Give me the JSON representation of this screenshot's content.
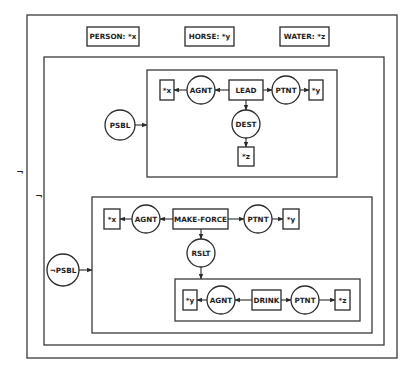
{
  "diagram": {
    "type": "conceptual-graph",
    "negations": [
      "¬",
      "¬"
    ],
    "declarations": [
      {
        "id": "decl-person",
        "label": "PERSON:  *x"
      },
      {
        "id": "decl-horse",
        "label": "HORSE:  *y"
      },
      {
        "id": "decl-water",
        "label": "WATER:  *z"
      }
    ],
    "contexts": {
      "possible": {
        "modal": "PSBL",
        "nodes": {
          "x": "*x",
          "agnt": "AGNT",
          "act": "LEAD",
          "ptnt": "PTNT",
          "y": "*y",
          "dest": "DEST",
          "z": "*z"
        }
      },
      "not_possible": {
        "modal": "¬PSBL",
        "nodes": {
          "x": "*x",
          "agnt": "AGNT",
          "act": "MAKE-FORCE",
          "ptnt": "PTNT",
          "y": "*y",
          "rslt": "RSLT"
        },
        "result": {
          "nodes": {
            "y": "*y",
            "agnt": "AGNT",
            "act": "DRINK",
            "ptnt": "PTNT",
            "z": "*z"
          }
        }
      }
    },
    "colors": {
      "line": "#2a2a2a",
      "background": "#ffffff"
    }
  }
}
